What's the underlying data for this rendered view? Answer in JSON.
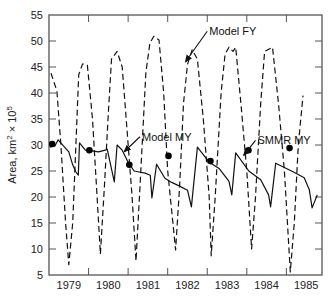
{
  "chart_data": {
    "type": "line",
    "title": "",
    "xlabel": "",
    "ylabel": "Area, km² × 10⁵",
    "ylabel_parts": {
      "base": "Area, km",
      "sup1": "2",
      "mid": " × 10",
      "sup2": "5"
    },
    "ylim": [
      5,
      55
    ],
    "xlim": [
      1979.0,
      1985.9
    ],
    "yticks": [
      5,
      10,
      15,
      20,
      25,
      30,
      35,
      40,
      45,
      50,
      55
    ],
    "xticks_year_boundaries": [
      1980,
      1981,
      1982,
      1983,
      1984,
      1985
    ],
    "xtick_labels": [
      "1979",
      "1980",
      "1981",
      "1982",
      "1983",
      "1984",
      "1985"
    ],
    "grid": false,
    "series": [
      {
        "name": "Model FY",
        "style": "dashed",
        "points": [
          [
            1979.05,
            43.8
          ],
          [
            1979.2,
            40.4
          ],
          [
            1979.3,
            30
          ],
          [
            1979.42,
            15
          ],
          [
            1979.5,
            7.0
          ],
          [
            1979.6,
            15
          ],
          [
            1979.68,
            30
          ],
          [
            1979.75,
            43.5
          ],
          [
            1979.85,
            45.6
          ],
          [
            1979.97,
            45.3
          ],
          [
            1980.1,
            35
          ],
          [
            1980.2,
            22
          ],
          [
            1980.3,
            9.0
          ],
          [
            1980.4,
            22
          ],
          [
            1980.5,
            36
          ],
          [
            1980.58,
            46.5
          ],
          [
            1980.72,
            48.0
          ],
          [
            1980.85,
            45
          ],
          [
            1980.95,
            35
          ],
          [
            1981.1,
            20
          ],
          [
            1981.2,
            7.7
          ],
          [
            1981.3,
            22
          ],
          [
            1981.45,
            44
          ],
          [
            1981.55,
            49.6
          ],
          [
            1981.65,
            50.9
          ],
          [
            1981.78,
            50.2
          ],
          [
            1981.9,
            40
          ],
          [
            1982.0,
            25
          ],
          [
            1982.2,
            9.8
          ],
          [
            1982.3,
            22
          ],
          [
            1982.4,
            38
          ],
          [
            1982.5,
            45.5
          ],
          [
            1982.62,
            48.3
          ],
          [
            1982.75,
            46.5
          ],
          [
            1982.9,
            35
          ],
          [
            1983.05,
            20
          ],
          [
            1983.1,
            8.7
          ],
          [
            1983.2,
            20
          ],
          [
            1983.35,
            40
          ],
          [
            1983.45,
            47.5
          ],
          [
            1983.55,
            48.8
          ],
          [
            1983.65,
            48.0
          ],
          [
            1983.72,
            48.8
          ],
          [
            1983.85,
            38
          ],
          [
            1984.0,
            25
          ],
          [
            1984.12,
            10.0
          ],
          [
            1984.22,
            20
          ],
          [
            1984.35,
            38
          ],
          [
            1984.45,
            48.0
          ],
          [
            1984.65,
            48.8
          ],
          [
            1984.8,
            38
          ],
          [
            1984.95,
            25
          ],
          [
            1985.1,
            5.6
          ],
          [
            1985.2,
            15
          ],
          [
            1985.3,
            30
          ],
          [
            1985.42,
            39.5
          ]
        ]
      },
      {
        "name": "Model MY",
        "style": "solid",
        "points": [
          [
            1979.02,
            29.6
          ],
          [
            1979.15,
            29.8
          ],
          [
            1979.23,
            31.0
          ],
          [
            1979.5,
            28.7
          ],
          [
            1979.6,
            26.2
          ],
          [
            1979.68,
            24.8
          ],
          [
            1979.74,
            24.2
          ],
          [
            1979.77,
            30.4
          ],
          [
            1979.92,
            29.0
          ],
          [
            1980.05,
            28.9
          ],
          [
            1980.25,
            28.7
          ],
          [
            1980.42,
            29.0
          ],
          [
            1980.47,
            29.2
          ],
          [
            1980.65,
            22.9
          ],
          [
            1980.72,
            30.0
          ],
          [
            1980.85,
            29.0
          ],
          [
            1981.0,
            26.7
          ],
          [
            1981.15,
            25.0
          ],
          [
            1981.28,
            24.8
          ],
          [
            1981.43,
            24.6
          ],
          [
            1981.56,
            24.2
          ],
          [
            1981.6,
            19.8
          ],
          [
            1981.72,
            26.3
          ],
          [
            1981.93,
            23.6
          ],
          [
            1982.1,
            22.8
          ],
          [
            1982.3,
            22.1
          ],
          [
            1982.5,
            21.3
          ],
          [
            1982.6,
            18.1
          ],
          [
            1982.75,
            29.6
          ],
          [
            1983.05,
            26.7
          ],
          [
            1983.3,
            25.5
          ],
          [
            1983.55,
            23.0
          ],
          [
            1983.62,
            20.4
          ],
          [
            1983.72,
            28.5
          ],
          [
            1984.05,
            25.0
          ],
          [
            1984.35,
            23.3
          ],
          [
            1984.55,
            20.4
          ],
          [
            1984.6,
            18.1
          ],
          [
            1984.73,
            26.5
          ],
          [
            1985.18,
            24.8
          ],
          [
            1985.45,
            23.7
          ],
          [
            1985.58,
            21.4
          ],
          [
            1985.65,
            17.9
          ],
          [
            1985.78,
            20.4
          ]
        ]
      },
      {
        "name": "SMMR MY",
        "style": "markers",
        "points": [
          [
            1979.08,
            30.2
          ],
          [
            1980.02,
            29.0
          ],
          [
            1981.03,
            26.2
          ],
          [
            1982.02,
            27.9
          ],
          [
            1983.08,
            26.9
          ],
          [
            1984.04,
            29.0
          ],
          [
            1985.08,
            29.4
          ]
        ]
      }
    ],
    "annotations": [
      {
        "text": "Model FY",
        "text_xy": [
          1983.05,
          51.5
        ],
        "arrow_to": [
          1982.45,
          46.0
        ]
      },
      {
        "text": "Model MY",
        "text_xy": [
          1981.35,
          31.2
        ],
        "arrow_to": [
          1980.9,
          28.7
        ]
      },
      {
        "text": "SMMR MY",
        "text_xy": [
          1984.27,
          30.5
        ],
        "arrow_to": [
          1983.92,
          28.0
        ]
      }
    ]
  }
}
